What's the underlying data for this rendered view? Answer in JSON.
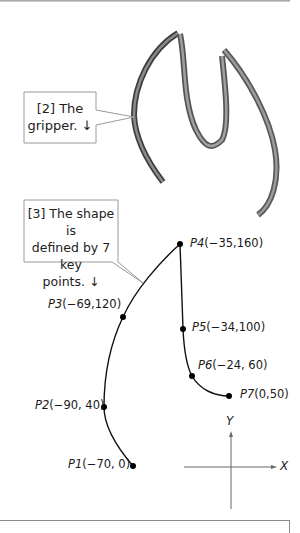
{
  "callouts": [
    {
      "id": "gripper",
      "line1": "[2] The",
      "line2": "gripper. ↓"
    },
    {
      "id": "shape",
      "line1": "[3] The shape is",
      "line2": "defined by 7 key",
      "line3": "points. ↓"
    }
  ],
  "key_points": [
    {
      "name": "P1",
      "coords": "(−70, 0)"
    },
    {
      "name": "P2",
      "coords": "(−90, 40)"
    },
    {
      "name": "P3",
      "coords": "(−69,120)"
    },
    {
      "name": "P4",
      "coords": "(−35,160)"
    },
    {
      "name": "P5",
      "coords": "(−34,100)"
    },
    {
      "name": "P6",
      "coords": "(−24, 60)"
    },
    {
      "name": "P7",
      "coords": "(0,50)"
    }
  ],
  "axes": {
    "x_label": "X",
    "y_label": "Y"
  },
  "colors": {
    "ribbon": "#7a7a7a",
    "ribbon_dark": "#4a4a4a",
    "curve": "#111111",
    "callout_border": "#9a9a9a"
  }
}
